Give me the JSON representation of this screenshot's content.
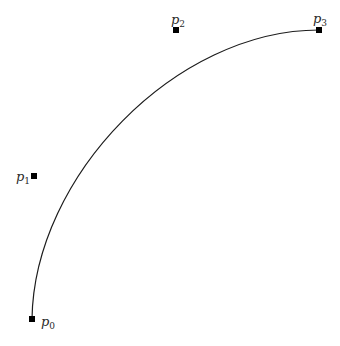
{
  "figure": {
    "width": 340,
    "height": 346,
    "background_color": "#ffffff",
    "curve_color": "#1c1c1c",
    "curve_stroke_width": 1.2,
    "point_color": "#000000",
    "point_size": 6,
    "label_color": "#2a2a2a"
  },
  "points": [
    {
      "id": "p0",
      "label": "p",
      "subscript": "0",
      "x": 32,
      "y": 319,
      "label_x": 41,
      "label_y": 326,
      "role": "endpoint-start"
    },
    {
      "id": "p1",
      "label": "p",
      "subscript": "1",
      "x": 34,
      "y": 176,
      "label_x": 16,
      "label_y": 181,
      "role": "control"
    },
    {
      "id": "p2",
      "label": "p",
      "subscript": "2",
      "x": 176,
      "y": 30,
      "label_x": 171,
      "label_y": 24,
      "role": "control"
    },
    {
      "id": "p3",
      "label": "p",
      "subscript": "3",
      "x": 319,
      "y": 30,
      "label_x": 313,
      "label_y": 23,
      "role": "endpoint-end"
    }
  ],
  "curve": {
    "type": "cubic-bezier",
    "from": "p0",
    "control1": "p1",
    "control2": "p2",
    "to": "p3"
  }
}
